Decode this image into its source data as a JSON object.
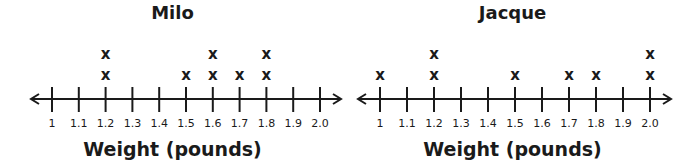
{
  "chart_data": [
    {
      "type": "dot_plot",
      "title": "Milo",
      "xlabel": "Weight (pounds)",
      "ylabel": "",
      "ticks": [
        "1",
        "1.1",
        "1.2",
        "1.3",
        "1.4",
        "1.5",
        "1.6",
        "1.7",
        "1.8",
        "1.9",
        "2.0"
      ],
      "tick_values": [
        1.0,
        1.1,
        1.2,
        1.3,
        1.4,
        1.5,
        1.6,
        1.7,
        1.8,
        1.9,
        2.0
      ],
      "xlim": [
        1.0,
        2.0
      ],
      "marker": "x",
      "counts": {
        "1.2": 2,
        "1.5": 1,
        "1.6": 2,
        "1.7": 1,
        "1.8": 2
      },
      "values": [
        1.2,
        1.2,
        1.5,
        1.6,
        1.6,
        1.7,
        1.8,
        1.8
      ],
      "grid": false,
      "legend": null
    },
    {
      "type": "dot_plot",
      "title": "Jacque",
      "xlabel": "Weight (pounds)",
      "ylabel": "",
      "ticks": [
        "1",
        "1.1",
        "1.2",
        "1.3",
        "1.4",
        "1.5",
        "1.6",
        "1.7",
        "1.8",
        "1.9",
        "2.0"
      ],
      "tick_values": [
        1.0,
        1.1,
        1.2,
        1.3,
        1.4,
        1.5,
        1.6,
        1.7,
        1.8,
        1.9,
        2.0
      ],
      "xlim": [
        1.0,
        2.0
      ],
      "marker": "x",
      "counts": {
        "1": 1,
        "1.2": 2,
        "1.5": 1,
        "1.7": 1,
        "1.8": 1,
        "2.0": 2
      },
      "values": [
        1.0,
        1.2,
        1.2,
        1.5,
        1.7,
        1.8,
        2.0,
        2.0
      ],
      "grid": false,
      "legend": null
    }
  ],
  "plots": [
    {
      "title": "Milo",
      "xlabel": "Weight (pounds)",
      "marker_glyph": "x",
      "ticks": [
        "1",
        "1.1",
        "1.2",
        "1.3",
        "1.4",
        "1.5",
        "1.6",
        "1.7",
        "1.8",
        "1.9",
        "2.0"
      ],
      "stacks": [
        0,
        0,
        2,
        0,
        0,
        1,
        2,
        1,
        2,
        0,
        0
      ]
    },
    {
      "title": "Jacque",
      "xlabel": "Weight (pounds)",
      "marker_glyph": "x",
      "ticks": [
        "1",
        "1.1",
        "1.2",
        "1.3",
        "1.4",
        "1.5",
        "1.6",
        "1.7",
        "1.8",
        "1.9",
        "2.0"
      ],
      "stacks": [
        1,
        0,
        2,
        0,
        0,
        1,
        0,
        1,
        1,
        0,
        2
      ]
    }
  ],
  "colors": {
    "ink": "#1a1a1a",
    "background": "#ffffff"
  }
}
